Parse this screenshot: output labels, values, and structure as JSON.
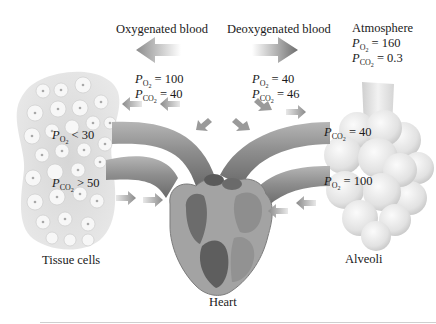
{
  "labels": {
    "oxygenated": "Oxygenated blood",
    "deoxygenated": "Deoxygenated blood",
    "atmosphere": "Atmosphere",
    "tissue": "Tissue cells",
    "alveoli": "Alveoli",
    "heart": "Heart"
  },
  "pressures": {
    "oxygenated_blood": [
      {
        "gas": "O2",
        "op": "=",
        "value": "100"
      },
      {
        "gas": "CO2",
        "op": "=",
        "value": "40"
      }
    ],
    "deoxygenated_blood": [
      {
        "gas": "O2",
        "op": "=",
        "value": "40"
      },
      {
        "gas": "CO2",
        "op": "=",
        "value": "46"
      }
    ],
    "atmosphere": [
      {
        "gas": "O2",
        "op": "=",
        "value": "160"
      },
      {
        "gas": "CO2",
        "op": "=",
        "value": "0.3"
      }
    ],
    "tissue_cells": [
      {
        "gas": "O2",
        "op": "<",
        "value": "30"
      },
      {
        "gas": "CO2",
        "op": ">",
        "value": "50"
      }
    ],
    "alveoli": [
      {
        "gas": "CO2",
        "op": "=",
        "value": "40"
      },
      {
        "gas": "O2",
        "op": "=",
        "value": "100"
      }
    ]
  },
  "symbols": {
    "P": "P",
    "O": "O",
    "CO": "CO",
    "two": "2"
  },
  "arrows": {
    "oxygenated_direction": "left",
    "deoxygenated_direction": "right"
  },
  "colors": {
    "vessel": "#8a8a8a",
    "heart_dark": "#5a5a5a",
    "tissue": "#cfcfcf",
    "alveoli": "#e4e4e4"
  }
}
